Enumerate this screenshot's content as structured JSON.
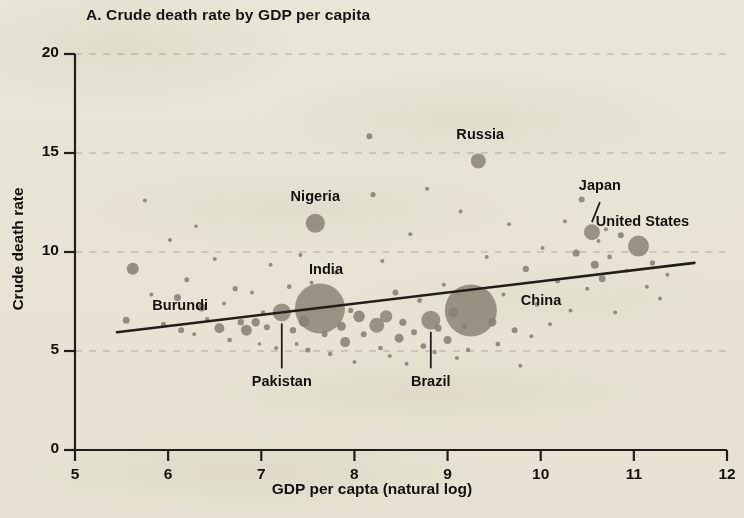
{
  "chart_data": {
    "type": "scatter",
    "title": "A. Crude death rate by GDP per capita",
    "xlabel": "GDP per capta (natural log)",
    "ylabel": "Crude death rate",
    "xlim": [
      5,
      12
    ],
    "ylim": [
      0,
      20
    ],
    "xticks": [
      "5",
      "6",
      "7",
      "8",
      "9",
      "10",
      "11",
      "12"
    ],
    "yticks": [
      "0",
      "5",
      "10",
      "15",
      "20"
    ],
    "grid": "horizontal dashed gridlines at y = 5, 10, 15, 20",
    "legend": "none",
    "marker_note": "bubble area proportional to population",
    "bubble_color": "#8d897f",
    "trendline_color": "#241f1b",
    "background_color": "#f4f2ea",
    "trendline": {
      "x": [
        5.45,
        11.65
      ],
      "y": [
        5.95,
        9.45
      ]
    },
    "labeled_points": [
      {
        "name": "Burundi",
        "x": 5.55,
        "y": 6.55,
        "r": 3.5,
        "label_dx": 26,
        "label_dy": -14,
        "leader": false
      },
      {
        "name": "Nigeria",
        "x": 7.58,
        "y": 11.45,
        "r": 9.5,
        "label_dx": 0,
        "label_dy": -26,
        "leader": false
      },
      {
        "name": "India",
        "x": 7.63,
        "y": 7.15,
        "r": 25.0,
        "label_dx": 6,
        "label_dy": -38,
        "leader": false
      },
      {
        "name": "Pakistan",
        "x": 7.22,
        "y": 6.95,
        "r": 9.0,
        "label_dx": 0,
        "label_dy": 70,
        "leader": true
      },
      {
        "name": "Brazil",
        "x": 8.82,
        "y": 6.55,
        "r": 9.5,
        "label_dx": 0,
        "label_dy": 62,
        "leader": true
      },
      {
        "name": "China",
        "x": 9.25,
        "y": 7.05,
        "r": 26.0,
        "label_dx": 50,
        "label_dy": -9,
        "leader": false
      },
      {
        "name": "Russia",
        "x": 9.33,
        "y": 14.6,
        "r": 7.5,
        "label_dx": 2,
        "label_dy": -26,
        "leader": false
      },
      {
        "name": "Japan",
        "x": 10.55,
        "y": 11.0,
        "r": 8.0,
        "label_dx": 8,
        "label_dy": -46,
        "leader": true
      },
      {
        "name": "United States",
        "x": 11.05,
        "y": 10.3,
        "r": 10.5,
        "label_dx": 4,
        "label_dy": -24,
        "leader": false
      }
    ],
    "points": [
      {
        "x": 5.62,
        "y": 9.15,
        "r": 6.0
      },
      {
        "x": 5.75,
        "y": 12.6,
        "r": 2.0
      },
      {
        "x": 5.82,
        "y": 7.85,
        "r": 2.0
      },
      {
        "x": 5.95,
        "y": 6.35,
        "r": 2.5
      },
      {
        "x": 6.02,
        "y": 10.6,
        "r": 2.0
      },
      {
        "x": 6.1,
        "y": 7.7,
        "r": 3.5
      },
      {
        "x": 6.14,
        "y": 6.05,
        "r": 3.0
      },
      {
        "x": 6.2,
        "y": 8.6,
        "r": 2.5
      },
      {
        "x": 6.28,
        "y": 5.85,
        "r": 2.0
      },
      {
        "x": 6.3,
        "y": 11.3,
        "r": 1.8
      },
      {
        "x": 6.36,
        "y": 7.2,
        "r": 4.0
      },
      {
        "x": 6.42,
        "y": 6.6,
        "r": 2.2
      },
      {
        "x": 6.5,
        "y": 9.65,
        "r": 2.0
      },
      {
        "x": 6.55,
        "y": 6.15,
        "r": 5.0
      },
      {
        "x": 6.6,
        "y": 7.4,
        "r": 2.0
      },
      {
        "x": 6.66,
        "y": 5.55,
        "r": 2.4
      },
      {
        "x": 6.72,
        "y": 8.15,
        "r": 2.6
      },
      {
        "x": 6.78,
        "y": 6.45,
        "r": 3.2
      },
      {
        "x": 6.84,
        "y": 6.05,
        "r": 5.5
      },
      {
        "x": 6.9,
        "y": 7.95,
        "r": 2.0
      },
      {
        "x": 6.94,
        "y": 6.45,
        "r": 4.2
      },
      {
        "x": 6.98,
        "y": 5.35,
        "r": 1.8
      },
      {
        "x": 7.02,
        "y": 6.95,
        "r": 2.2
      },
      {
        "x": 7.06,
        "y": 6.2,
        "r": 3.0
      },
      {
        "x": 7.1,
        "y": 9.35,
        "r": 2.0
      },
      {
        "x": 7.16,
        "y": 5.15,
        "r": 2.0
      },
      {
        "x": 7.3,
        "y": 8.25,
        "r": 2.4
      },
      {
        "x": 7.34,
        "y": 6.05,
        "r": 3.2
      },
      {
        "x": 7.38,
        "y": 5.35,
        "r": 2.0
      },
      {
        "x": 7.42,
        "y": 9.85,
        "r": 2.0
      },
      {
        "x": 7.46,
        "y": 6.5,
        "r": 5.5
      },
      {
        "x": 7.5,
        "y": 5.05,
        "r": 2.6
      },
      {
        "x": 7.54,
        "y": 8.45,
        "r": 2.0
      },
      {
        "x": 7.68,
        "y": 5.85,
        "r": 3.0
      },
      {
        "x": 7.74,
        "y": 4.85,
        "r": 2.2
      },
      {
        "x": 7.8,
        "y": 8.95,
        "r": 2.0
      },
      {
        "x": 7.86,
        "y": 6.25,
        "r": 4.5
      },
      {
        "x": 7.9,
        "y": 5.45,
        "r": 5.0
      },
      {
        "x": 7.96,
        "y": 7.05,
        "r": 2.6
      },
      {
        "x": 8.0,
        "y": 4.45,
        "r": 2.0
      },
      {
        "x": 8.05,
        "y": 6.75,
        "r": 5.8
      },
      {
        "x": 8.1,
        "y": 5.85,
        "r": 3.0
      },
      {
        "x": 8.16,
        "y": 15.85,
        "r": 3.0
      },
      {
        "x": 8.2,
        "y": 12.9,
        "r": 2.6
      },
      {
        "x": 8.24,
        "y": 6.3,
        "r": 7.5
      },
      {
        "x": 8.28,
        "y": 5.15,
        "r": 2.4
      },
      {
        "x": 8.3,
        "y": 9.55,
        "r": 2.0
      },
      {
        "x": 8.34,
        "y": 6.75,
        "r": 6.2
      },
      {
        "x": 8.38,
        "y": 4.75,
        "r": 2.0
      },
      {
        "x": 8.44,
        "y": 7.95,
        "r": 3.0
      },
      {
        "x": 8.48,
        "y": 5.65,
        "r": 4.5
      },
      {
        "x": 8.52,
        "y": 6.45,
        "r": 3.6
      },
      {
        "x": 8.56,
        "y": 4.35,
        "r": 2.0
      },
      {
        "x": 8.6,
        "y": 10.9,
        "r": 2.0
      },
      {
        "x": 8.64,
        "y": 5.95,
        "r": 3.0
      },
      {
        "x": 8.7,
        "y": 7.55,
        "r": 2.4
      },
      {
        "x": 8.74,
        "y": 5.25,
        "r": 2.8
      },
      {
        "x": 8.78,
        "y": 13.2,
        "r": 2.0
      },
      {
        "x": 8.86,
        "y": 4.95,
        "r": 2.2
      },
      {
        "x": 8.9,
        "y": 6.15,
        "r": 3.4
      },
      {
        "x": 8.96,
        "y": 8.35,
        "r": 2.0
      },
      {
        "x": 9.0,
        "y": 5.55,
        "r": 4.0
      },
      {
        "x": 9.06,
        "y": 6.95,
        "r": 4.8
      },
      {
        "x": 9.1,
        "y": 4.65,
        "r": 2.0
      },
      {
        "x": 9.14,
        "y": 12.05,
        "r": 2.0
      },
      {
        "x": 9.18,
        "y": 6.25,
        "r": 2.6
      },
      {
        "x": 9.22,
        "y": 5.05,
        "r": 2.2
      },
      {
        "x": 9.42,
        "y": 9.75,
        "r": 2.0
      },
      {
        "x": 9.48,
        "y": 6.45,
        "r": 4.2
      },
      {
        "x": 9.54,
        "y": 5.35,
        "r": 2.4
      },
      {
        "x": 9.6,
        "y": 7.85,
        "r": 2.0
      },
      {
        "x": 9.66,
        "y": 11.4,
        "r": 2.0
      },
      {
        "x": 9.72,
        "y": 6.05,
        "r": 3.0
      },
      {
        "x": 9.78,
        "y": 4.25,
        "r": 2.0
      },
      {
        "x": 9.84,
        "y": 9.15,
        "r": 3.2
      },
      {
        "x": 9.9,
        "y": 5.75,
        "r": 2.0
      },
      {
        "x": 9.96,
        "y": 7.35,
        "r": 2.4
      },
      {
        "x": 10.02,
        "y": 10.2,
        "r": 2.0
      },
      {
        "x": 10.1,
        "y": 6.35,
        "r": 2.0
      },
      {
        "x": 10.18,
        "y": 8.55,
        "r": 2.6
      },
      {
        "x": 10.26,
        "y": 11.55,
        "r": 2.0
      },
      {
        "x": 10.32,
        "y": 7.05,
        "r": 2.0
      },
      {
        "x": 10.38,
        "y": 9.95,
        "r": 3.6
      },
      {
        "x": 10.44,
        "y": 12.65,
        "r": 3.0
      },
      {
        "x": 10.5,
        "y": 8.15,
        "r": 2.0
      },
      {
        "x": 10.58,
        "y": 9.35,
        "r": 4.0
      },
      {
        "x": 10.62,
        "y": 10.55,
        "r": 2.0
      },
      {
        "x": 10.66,
        "y": 8.65,
        "r": 3.4
      },
      {
        "x": 10.7,
        "y": 11.15,
        "r": 2.0
      },
      {
        "x": 10.74,
        "y": 9.75,
        "r": 2.4
      },
      {
        "x": 10.8,
        "y": 6.95,
        "r": 2.0
      },
      {
        "x": 10.86,
        "y": 10.85,
        "r": 3.0
      },
      {
        "x": 10.92,
        "y": 9.05,
        "r": 2.0
      },
      {
        "x": 11.14,
        "y": 8.25,
        "r": 2.0
      },
      {
        "x": 11.2,
        "y": 9.45,
        "r": 2.6
      },
      {
        "x": 11.28,
        "y": 7.65,
        "r": 2.0
      },
      {
        "x": 11.36,
        "y": 8.85,
        "r": 2.0
      }
    ]
  }
}
